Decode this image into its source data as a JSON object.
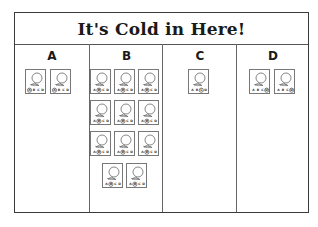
{
  "title": "It's Cold in Here!",
  "columns": [
    {
      "label": "A",
      "count": 2,
      "answer": "A"
    },
    {
      "label": "B",
      "count": 11,
      "answer": "B"
    },
    {
      "label": "C",
      "count": 1,
      "answer": "C"
    },
    {
      "label": "D",
      "count": 2,
      "answer": "D"
    }
  ],
  "card": {
    "choices": [
      "A",
      "B",
      "C",
      "D"
    ],
    "drawing": "balloon-with-string"
  },
  "colors": {
    "line": "#3a3a3a",
    "card_border": "#777777",
    "background": "#ffffff"
  }
}
